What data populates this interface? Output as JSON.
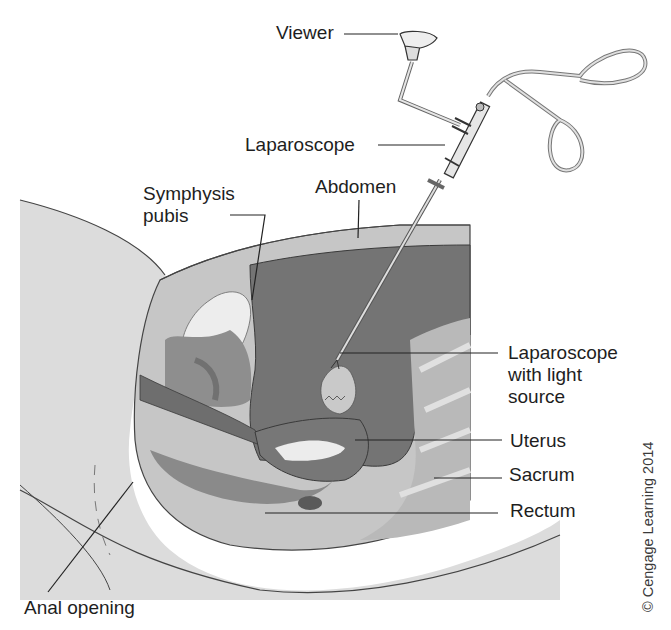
{
  "figure": {
    "labels": {
      "viewer": "Viewer",
      "laparoscope": "Laparoscope",
      "symphysis_pubis": "Symphysis\npubis",
      "abdomen": "Abdomen",
      "laparoscope_light": "Laparoscope\nwith light\nsource",
      "uterus": "Uterus",
      "sacrum": "Sacrum",
      "rectum": "Rectum",
      "anal_opening": "Anal opening"
    },
    "copyright": "© Cengage Learning 2014",
    "colors": {
      "skin": "#d9d9d9",
      "abdominal_wall": "#c4c4c4",
      "cavity": "#737373",
      "organ_dark": "#858585",
      "organ_mid": "#a8a8a8",
      "bone_light": "#e8e8e8",
      "outline": "#3c3c3c",
      "text": "#1e1e1e"
    }
  }
}
